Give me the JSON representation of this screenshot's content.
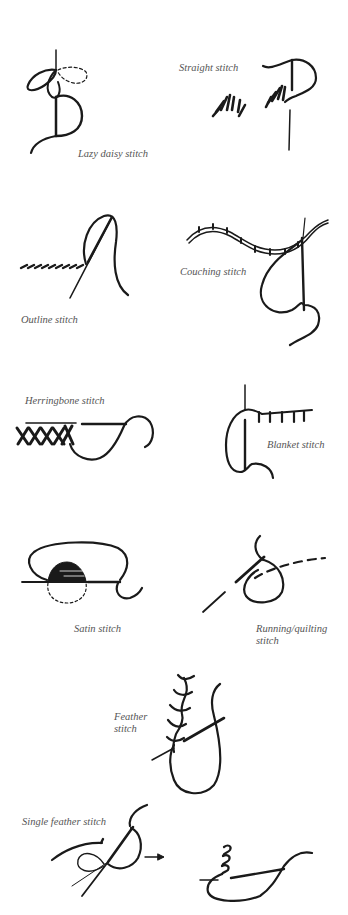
{
  "diagram": {
    "type": "embroidery stitch illustration sheet",
    "colors": {
      "background": "#ffffff",
      "ink": "#1a1a1a",
      "label_text": "#555555"
    },
    "stitches": [
      {
        "id": "lazy-daisy",
        "label": "Lazy daisy stitch"
      },
      {
        "id": "straight",
        "label": "Straight stitch"
      },
      {
        "id": "outline",
        "label": "Outline stitch"
      },
      {
        "id": "couching",
        "label": "Couching stitch"
      },
      {
        "id": "herringbone",
        "label": "Herringbone stitch"
      },
      {
        "id": "blanket",
        "label": "Blanket stitch"
      },
      {
        "id": "satin",
        "label": "Satin stitch"
      },
      {
        "id": "running-quilting",
        "label_line1": "Running/quilting",
        "label_line2": "stitch"
      },
      {
        "id": "feather",
        "label_line1": "Feather",
        "label_line2": "stitch"
      },
      {
        "id": "single-feather",
        "label": "Single feather stitch"
      }
    ]
  }
}
